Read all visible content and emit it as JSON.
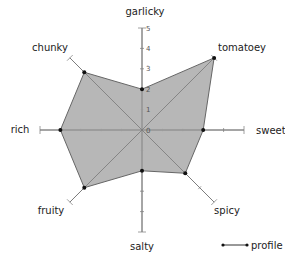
{
  "chart_data": {
    "type": "radar",
    "title": "",
    "categories": [
      "garlicky",
      "tomatoey",
      "sweet",
      "spicy",
      "salty",
      "fruity",
      "rich",
      "chunky"
    ],
    "series": [
      {
        "name": "profile",
        "values": [
          2,
          5,
          3,
          3,
          2,
          4,
          4,
          4
        ]
      }
    ],
    "rlim": [
      0,
      5
    ],
    "r_ticks": [
      "0",
      "1",
      "2",
      "3",
      "4",
      "5"
    ],
    "legend_position": "bottom-right",
    "fill_color": "#b3b3b3",
    "line_color": "#666666",
    "marker_color": "#111111",
    "axis_color": "#888888"
  },
  "legend": {
    "label": "profile"
  }
}
